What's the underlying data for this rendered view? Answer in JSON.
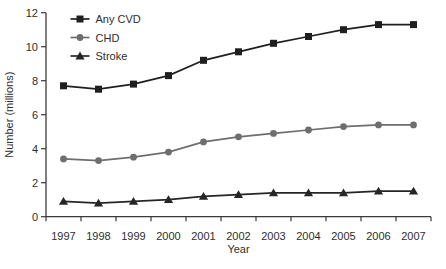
{
  "chart_data": {
    "type": "line",
    "title": "",
    "xlabel": "Year",
    "ylabel": "Number (millions)",
    "x": [
      1997,
      1998,
      1999,
      2000,
      2001,
      2002,
      2003,
      2004,
      2005,
      2006,
      2007
    ],
    "ylim": [
      0,
      12
    ],
    "yticks": [
      0,
      2,
      4,
      6,
      8,
      10,
      12
    ],
    "grid": false,
    "legend_position": "top-left",
    "series": [
      {
        "name": "Any CVD",
        "marker": "square",
        "color": "#1f1f1f",
        "values": [
          7.7,
          7.5,
          7.8,
          8.3,
          9.2,
          9.7,
          10.2,
          10.6,
          11.0,
          11.3,
          11.3
        ]
      },
      {
        "name": "CHD",
        "marker": "circle",
        "color": "#6e6e6e",
        "values": [
          3.4,
          3.3,
          3.5,
          3.8,
          4.4,
          4.7,
          4.9,
          5.1,
          5.3,
          5.4,
          5.4
        ]
      },
      {
        "name": "Stroke",
        "marker": "triangle",
        "color": "#262626",
        "values": [
          0.9,
          0.8,
          0.9,
          1.0,
          1.2,
          1.3,
          1.4,
          1.4,
          1.4,
          1.5,
          1.5
        ]
      }
    ],
    "colors": {
      "axis": "#3a3a3a",
      "text": "#2e2e2e",
      "background": "#ffffff"
    }
  }
}
